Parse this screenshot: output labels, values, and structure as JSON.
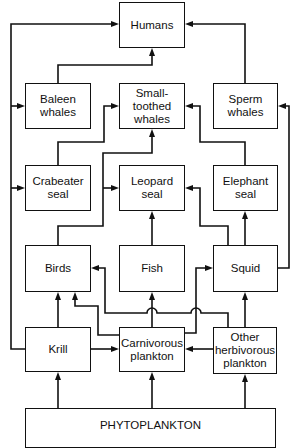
{
  "diagram": {
    "nodes": {
      "humans": {
        "label": "Humans"
      },
      "baleen_whales": {
        "label": "Baleen\nwhales"
      },
      "small_toothed_whales": {
        "label": "Small-\ntoothed\nwhales"
      },
      "sperm_whales": {
        "label": "Sperm\nwhales"
      },
      "crabeater_seal": {
        "label": "Crabeater\nseal"
      },
      "leopard_seal": {
        "label": "Leopard\nseal"
      },
      "elephant_seal": {
        "label": "Elephant\nseal"
      },
      "birds": {
        "label": "Birds"
      },
      "fish": {
        "label": "Fish"
      },
      "squid": {
        "label": "Squid"
      },
      "krill": {
        "label": "Krill"
      },
      "carnivorous_plankton": {
        "label": "Carnivorous\nplankton"
      },
      "other_herbivorous_plankton": {
        "label": "Other\nherbivorous\nplankton"
      },
      "phytoplankton": {
        "label": "PHYTOPLANKTON"
      }
    },
    "edges": [
      {
        "from": "Phytoplankton",
        "to": "Krill"
      },
      {
        "from": "Phytoplankton",
        "to": "Carnivorous plankton"
      },
      {
        "from": "Phytoplankton",
        "to": "Other herbivorous plankton"
      },
      {
        "from": "Krill",
        "to": "Carnivorous plankton"
      },
      {
        "from": "Other herbivorous plankton",
        "to": "Carnivorous plankton"
      },
      {
        "from": "Krill",
        "to": "Birds"
      },
      {
        "from": "Krill",
        "to": "Humans"
      },
      {
        "from": "Krill",
        "to": "Baleen whales"
      },
      {
        "from": "Krill",
        "to": "Crabeater seal"
      },
      {
        "from": "Carnivorous plankton",
        "to": "Birds"
      },
      {
        "from": "Carnivorous plankton",
        "to": "Fish"
      },
      {
        "from": "Carnivorous plankton",
        "to": "Squid"
      },
      {
        "from": "Other herbivorous plankton",
        "to": "Birds"
      },
      {
        "from": "Other herbivorous plankton",
        "to": "Squid"
      },
      {
        "from": "Birds",
        "to": "Leopard seal"
      },
      {
        "from": "Birds",
        "to": "Small-toothed whales"
      },
      {
        "from": "Fish",
        "to": "Leopard seal"
      },
      {
        "from": "Squid",
        "to": "Leopard seal"
      },
      {
        "from": "Squid",
        "to": "Elephant seal"
      },
      {
        "from": "Squid",
        "to": "Sperm whales"
      },
      {
        "from": "Crabeater seal",
        "to": "Small-toothed whales"
      },
      {
        "from": "Elephant seal",
        "to": "Small-toothed whales"
      },
      {
        "from": "Baleen whales",
        "to": "Humans"
      },
      {
        "from": "Sperm whales",
        "to": "Humans"
      }
    ]
  }
}
